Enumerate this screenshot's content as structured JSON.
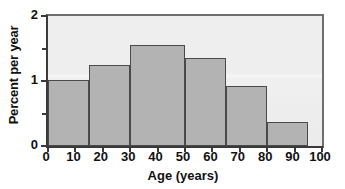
{
  "chart_data": {
    "type": "bar",
    "title": "",
    "xlabel": "Age (years)",
    "ylabel": "Percent per year",
    "xlim": [
      0,
      100
    ],
    "ylim": [
      0,
      2
    ],
    "grid": false,
    "legend": null,
    "x_ticks": [
      "0",
      "10",
      "20",
      "30",
      "40",
      "50",
      "60",
      "70",
      "80",
      "90",
      "100"
    ],
    "x_tick_values": [
      0,
      10,
      20,
      30,
      40,
      50,
      60,
      70,
      80,
      90,
      100
    ],
    "y_ticks": [
      "0",
      "1",
      "2"
    ],
    "y_tick_values": [
      0,
      1,
      2
    ],
    "y_minor_tick_values": [
      0.5,
      1.5
    ],
    "bins": [
      {
        "label": "0-15",
        "start": 0,
        "end": 15,
        "value": 1.02
      },
      {
        "label": "15-30",
        "start": 15,
        "end": 30,
        "value": 1.25
      },
      {
        "label": "30-50",
        "start": 30,
        "end": 50,
        "value": 1.55
      },
      {
        "label": "50-65",
        "start": 50,
        "end": 65,
        "value": 1.35
      },
      {
        "label": "65-80",
        "start": 65,
        "end": 80,
        "value": 0.92
      },
      {
        "label": "80-95",
        "start": 80,
        "end": 95,
        "value": 0.37
      }
    ],
    "bar_fill_color": "#b3b3b3",
    "bar_edge_color": "#4a4a4a",
    "plot_background_color": "#eeeeee",
    "axis_color": "#3a3a3a",
    "text_color": "#111111"
  }
}
